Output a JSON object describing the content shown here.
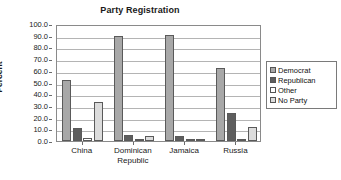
{
  "chart_data": {
    "type": "bar",
    "title": "Party Registration",
    "xlabel": "",
    "ylabel": "Percent",
    "ylim": [
      0,
      100
    ],
    "ytick_labels": [
      "100.0",
      "90.0",
      "80.0",
      "70.0",
      "60.0",
      "50.0",
      "40.0",
      "30.0",
      "20.0",
      "10.0",
      "0.0"
    ],
    "ytick_values": [
      100,
      90,
      80,
      70,
      60,
      50,
      40,
      30,
      20,
      10,
      0
    ],
    "grid": true,
    "legend_position": "right",
    "categories": [
      "China",
      "Dominican Republic",
      "Jamaica",
      "Russia"
    ],
    "category_lines": [
      [
        "China"
      ],
      [
        "Dominican",
        "Republic"
      ],
      [
        "Jamaica"
      ],
      [
        "Russia"
      ]
    ],
    "series": [
      {
        "name": "Democrat",
        "color": "#a8a8a8",
        "values": [
          52.0,
          90.0,
          90.5,
          62.0
        ]
      },
      {
        "name": "Republican",
        "color": "#5e5e5e",
        "values": [
          11.5,
          5.5,
          4.5,
          24.0
        ]
      },
      {
        "name": "Other",
        "color": "#ffffff",
        "values": [
          2.5,
          1.0,
          2.0,
          1.0
        ]
      },
      {
        "name": "No Party",
        "color": "#dcdcdc",
        "values": [
          33.0,
          4.0,
          2.0,
          12.0
        ]
      }
    ]
  }
}
